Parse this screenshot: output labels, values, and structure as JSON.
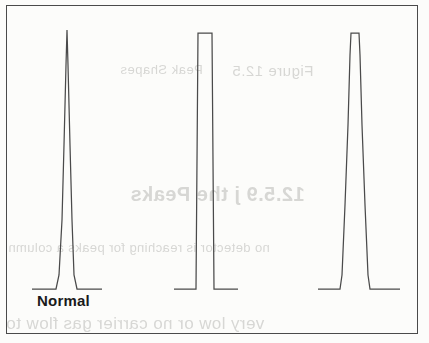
{
  "figure": {
    "title": "",
    "caption_label": "Normal",
    "frame_color": "#4a4a4a",
    "trace_color": "#4a4a4a",
    "background_color": "#fcfcfa"
  },
  "ghost_text": {
    "line_1": "Figure 12.5",
    "line_2": "Peak Shapes",
    "line_3": "12.5.9 j the Peaks",
    "line_4": "no detector is reaching for peaks a column",
    "line_5": "very low or no carrier gas flow to"
  },
  "chart_data": {
    "type": "line",
    "xlabel": "",
    "ylabel": "",
    "grid": false,
    "legend": "none",
    "xlim": [
      0,
      412
    ],
    "ylim": [
      0,
      329
    ],
    "annotations": [
      {
        "text": "Normal",
        "x": 37,
        "y": 292,
        "for_series": "normal-peak"
      }
    ],
    "series": [
      {
        "name": "normal-peak",
        "label": "Normal",
        "shape": "sharp-symmetric-spike",
        "baseline_y": 284,
        "apex_y": 25,
        "apex_x": 61,
        "base_left_x": 26,
        "base_right_x": 96,
        "top_width": 2,
        "points": [
          [
            26,
            284
          ],
          [
            50,
            284
          ],
          [
            53,
            270
          ],
          [
            56,
            215
          ],
          [
            58,
            140
          ],
          [
            60,
            60
          ],
          [
            61,
            25
          ],
          [
            62,
            60
          ],
          [
            64,
            140
          ],
          [
            66,
            215
          ],
          [
            68,
            270
          ],
          [
            71,
            284
          ],
          [
            96,
            284
          ]
        ]
      },
      {
        "name": "flat-topped-peak",
        "label": "",
        "shape": "flat-top-rectangular",
        "baseline_y": 284,
        "apex_y": 28,
        "apex_x": 199,
        "base_left_x": 168,
        "base_right_x": 232,
        "top_width": 14,
        "points": [
          [
            168,
            284
          ],
          [
            190,
            284
          ],
          [
            192,
            28
          ],
          [
            206,
            28
          ],
          [
            208,
            284
          ],
          [
            232,
            284
          ]
        ]
      },
      {
        "name": "broad-trapezoid-peak",
        "label": "",
        "shape": "broad-flat-top-trapezoid",
        "baseline_y": 284,
        "apex_y": 28,
        "apex_x": 347,
        "base_left_x": 312,
        "base_right_x": 394,
        "top_width": 10,
        "points": [
          [
            312,
            284
          ],
          [
            334,
            284
          ],
          [
            336,
            270
          ],
          [
            339,
            200
          ],
          [
            342,
            120
          ],
          [
            344,
            50
          ],
          [
            345,
            28
          ],
          [
            353,
            28
          ],
          [
            354,
            50
          ],
          [
            356,
            120
          ],
          [
            359,
            200
          ],
          [
            362,
            270
          ],
          [
            364,
            284
          ],
          [
            394,
            284
          ]
        ]
      }
    ]
  }
}
